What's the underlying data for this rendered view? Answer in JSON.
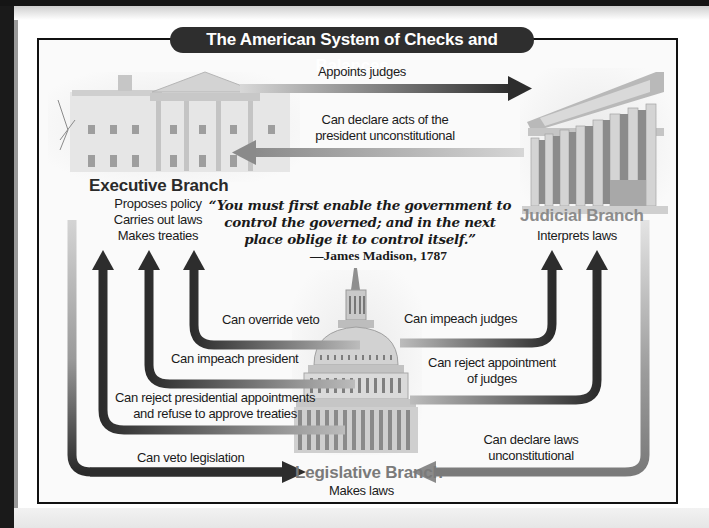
{
  "title": "The American System of Checks and Balances",
  "branches": {
    "executive": {
      "name": "Executive Branch",
      "duties": [
        "Proposes policy",
        "Carries out laws",
        "Makes treaties"
      ],
      "image": "white-house-illustration"
    },
    "judicial": {
      "name": "Judicial Branch",
      "duties": [
        "Interprets laws"
      ],
      "image": "supreme-court-illustration"
    },
    "legislative": {
      "name": "Legislative Branch",
      "duties": [
        "Makes laws"
      ],
      "image": "capitol-dome-illustration"
    }
  },
  "quote": {
    "text": "“You must first enable the government to control the governed; and in the next place oblige it to control itself.”",
    "attribution": "—James Madison, 1787"
  },
  "checks": [
    {
      "from": "executive",
      "to": "judicial",
      "label": "Appoints judges"
    },
    {
      "from": "judicial",
      "to": "executive",
      "label_lines": [
        "Can declare acts of the",
        "president unconstitutional"
      ]
    },
    {
      "from": "legislative",
      "to": "executive",
      "label": "Can override veto"
    },
    {
      "from": "legislative",
      "to": "executive",
      "label": "Can impeach president"
    },
    {
      "from": "legislative",
      "to": "executive",
      "label_lines": [
        "Can reject presidential appointments",
        "and refuse to approve treaties"
      ]
    },
    {
      "from": "executive",
      "to": "legislative",
      "label": "Can veto legislation"
    },
    {
      "from": "legislative",
      "to": "judicial",
      "label": "Can impeach judges"
    },
    {
      "from": "legislative",
      "to": "judicial",
      "label_lines": [
        "Can reject appointment",
        "of judges"
      ]
    },
    {
      "from": "judicial",
      "to": "legislative",
      "label_lines": [
        "Can declare laws",
        "unconstitutional"
      ]
    }
  ]
}
